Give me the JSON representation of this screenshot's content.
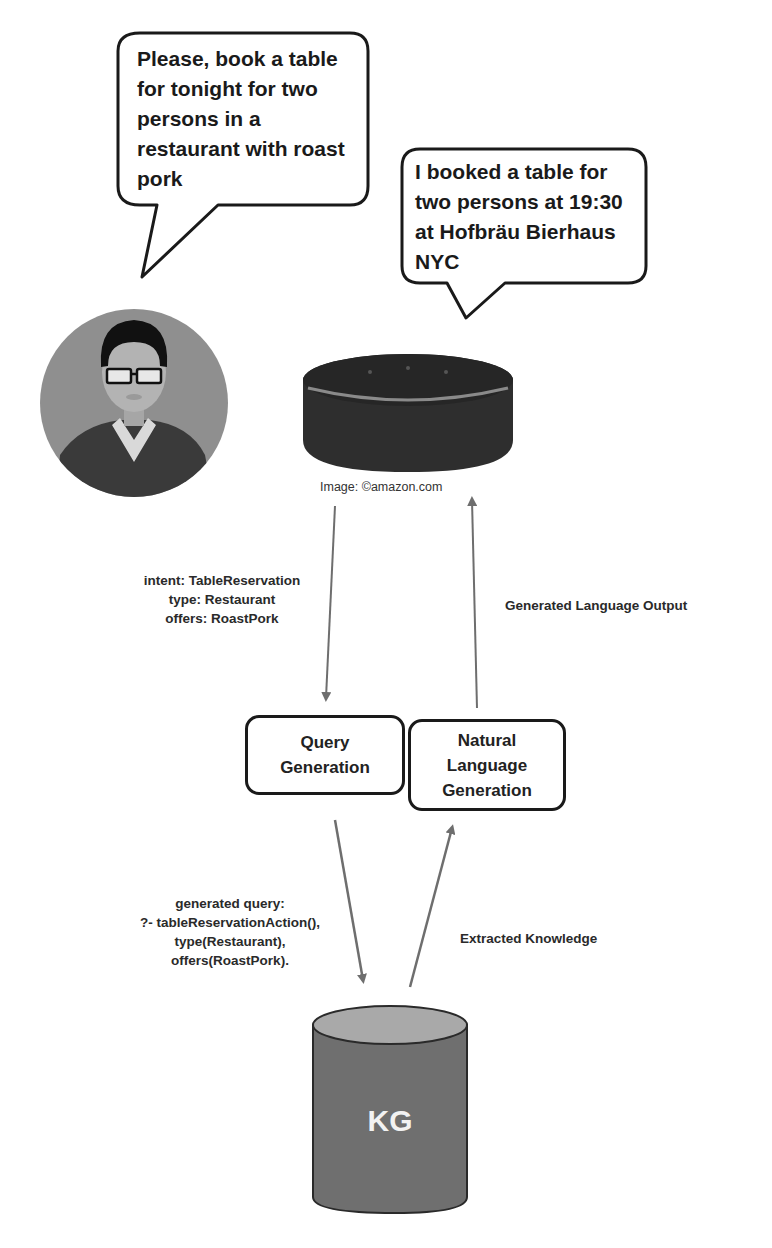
{
  "user_bubble": {
    "lines": [
      "Please, book a table",
      "for tonight for two",
      "persons in a",
      "restaurant with roast",
      "pork"
    ]
  },
  "assistant_bubble": {
    "lines": [
      "I booked a table for",
      "two persons at 19:30",
      "at Hofbräu Bierhaus",
      "NYC"
    ]
  },
  "user_avatar": {
    "icon": "user-avatar-icon"
  },
  "smart_speaker": {
    "icon": "smart-speaker-icon",
    "caption": "Image: ©amazon.com"
  },
  "intent_label": {
    "lines": [
      "intent: TableReservation",
      "type: Restaurant",
      "offers: RoastPork"
    ]
  },
  "output_label": {
    "text": "Generated Language Output"
  },
  "nodes": {
    "query_generation": {
      "lines": [
        "Query",
        "Generation"
      ]
    },
    "nlg": {
      "lines": [
        "Natural",
        "Language",
        "Generation"
      ]
    },
    "kg": {
      "label": "KG"
    }
  },
  "query_label": {
    "lines": [
      "generated query:",
      "?- tableReservationAction(),",
      "type(Restaurant),",
      "offers(RoastPork)."
    ]
  },
  "knowledge_label": {
    "text": "Extracted Knowledge"
  },
  "colors": {
    "arrow": "#6e6e6e",
    "avatar_bg": "#8f8f8f",
    "kg_body": "#6f6f6f",
    "kg_top": "#a9a9a9",
    "speaker": "#2e2e2e"
  }
}
